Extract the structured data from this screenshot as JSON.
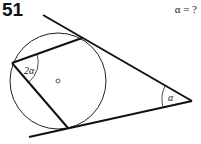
{
  "problem": {
    "number": "51",
    "question": "α = ?"
  },
  "figure": {
    "labels": {
      "inscribed_angle": "2α",
      "apex_angle": "α",
      "center": "O"
    },
    "circle": {
      "cx": 58,
      "cy": 81,
      "r": 48
    },
    "tangent_upper": {
      "x1": 43,
      "y1": 15,
      "x2": 192,
      "y2": 101
    },
    "tangent_lower": {
      "x1": 29,
      "y1": 137,
      "x2": 192,
      "y2": 101
    },
    "chord_upper": {
      "x1": 12,
      "y1": 63,
      "x2": 82,
      "y2": 38
    },
    "chord_lower": {
      "x1": 12,
      "y1": 63,
      "x2": 68,
      "y2": 128
    },
    "colors": {
      "stroke": "#111111"
    }
  }
}
